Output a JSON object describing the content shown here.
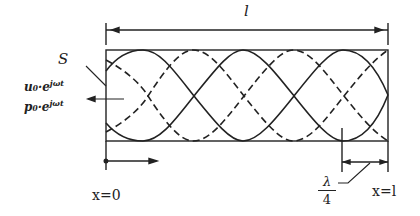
{
  "diagram": {
    "type": "standing-wave-tube",
    "labels": {
      "length": "l",
      "surface": "S",
      "velocity_source": "u₀·e",
      "velocity_exponent": "jωt",
      "pressure_source": "p₀·e",
      "pressure_exponent": "jωt",
      "origin": "x=0",
      "end": "x=l",
      "quarter_wavelength_num": "λ",
      "quarter_wavelength_den": "4"
    },
    "curves": {
      "solid": "velocity standing-wave envelope (±)",
      "dashed": "pressure standing-wave envelope (±)"
    },
    "colors": {
      "line": "#222222",
      "background": "#ffffff"
    }
  }
}
